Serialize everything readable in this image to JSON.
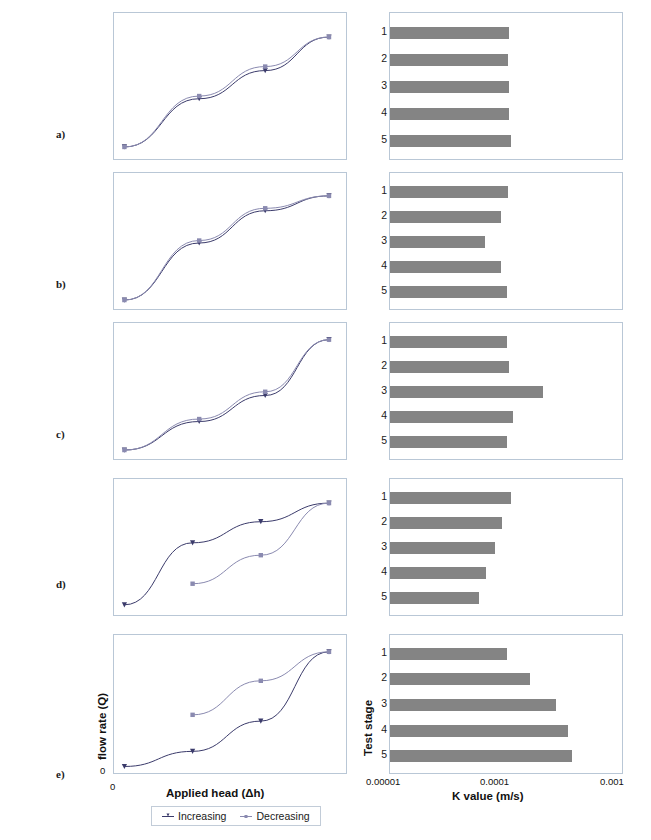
{
  "figure": {
    "rows": [
      {
        "tag": "a)",
        "left_axis_hidden": true
      },
      {
        "tag": "b)",
        "left_axis_hidden": true
      },
      {
        "tag": "c)",
        "left_axis_hidden": true
      },
      {
        "tag": "d)",
        "left_axis_hidden": true
      },
      {
        "tag": "e)",
        "left_axis_hidden": false
      }
    ]
  },
  "labels": {
    "y_axis_left": "flow rate (Q)",
    "x_axis_left": "Applied head (Δh)",
    "y_axis_right": "Test stage",
    "x_axis_right": "K value (m/s)",
    "zero_y": "0",
    "zero_x": "0"
  },
  "legend": {
    "items": [
      {
        "label": "Increasing",
        "color": "#3b3b6b",
        "marker": "line-marker-increasing"
      },
      {
        "label": "Decreasing",
        "color": "#8a8ab0",
        "marker": "line-marker-decreasing"
      }
    ]
  },
  "bar_axis": {
    "ticks": [
      "0.00001",
      "0.0001",
      "0.001"
    ],
    "scale": "log",
    "min": 1e-05,
    "max": 0.001,
    "stage_labels": [
      "1",
      "2",
      "3",
      "4",
      "5"
    ],
    "bar_color": "#848484"
  },
  "chart_data": [
    {
      "id": "a-left",
      "type": "line",
      "panel": "a",
      "title": "",
      "xlabel": "Applied head (Δh)",
      "ylabel": "flow rate (Q)",
      "xlim": [
        0,
        1
      ],
      "ylim": [
        0,
        1
      ],
      "grid": false,
      "legend_position": "bottom",
      "series": [
        {
          "name": "Increasing",
          "x": [
            0.02,
            0.36,
            0.66,
            0.95
          ],
          "y": [
            0.06,
            0.42,
            0.63,
            0.88
          ]
        },
        {
          "name": "Decreasing",
          "x": [
            0.02,
            0.36,
            0.66,
            0.95
          ],
          "y": [
            0.06,
            0.44,
            0.66,
            0.88
          ]
        }
      ]
    },
    {
      "id": "a-right",
      "type": "bar",
      "panel": "a",
      "title": "",
      "xlabel": "K value (m/s)",
      "ylabel": "Test stage",
      "orientation": "horizontal",
      "xscale": "log",
      "xlim": [
        1e-05,
        0.001
      ],
      "categories": [
        "1",
        "2",
        "3",
        "4",
        "5"
      ],
      "values": [
        0.000105,
        0.000102,
        0.000104,
        0.000103,
        0.000108
      ]
    },
    {
      "id": "b-left",
      "type": "line",
      "panel": "b",
      "title": "",
      "xlabel": "Applied head (Δh)",
      "ylabel": "flow rate (Q)",
      "xlim": [
        0,
        1
      ],
      "ylim": [
        0,
        1
      ],
      "grid": false,
      "series": [
        {
          "name": "Increasing",
          "x": [
            0.02,
            0.36,
            0.66,
            0.95
          ],
          "y": [
            0.04,
            0.5,
            0.76,
            0.88
          ]
        },
        {
          "name": "Decreasing",
          "x": [
            0.02,
            0.36,
            0.66,
            0.95
          ],
          "y": [
            0.04,
            0.52,
            0.78,
            0.88
          ]
        }
      ]
    },
    {
      "id": "b-right",
      "type": "bar",
      "panel": "b",
      "title": "",
      "xlabel": "K value (m/s)",
      "ylabel": "Test stage",
      "orientation": "horizontal",
      "xscale": "log",
      "xlim": [
        1e-05,
        0.001
      ],
      "categories": [
        "1",
        "2",
        "3",
        "4",
        "5"
      ],
      "values": [
        0.000101,
        8.95e-05,
        6.45e-05,
        8.95e-05,
        0.0001
      ]
    },
    {
      "id": "c-left",
      "type": "line",
      "panel": "c",
      "title": "",
      "xlabel": "Applied head (Δh)",
      "ylabel": "flow rate (Q)",
      "xlim": [
        0,
        1
      ],
      "ylim": [
        0,
        1
      ],
      "grid": false,
      "series": [
        {
          "name": "Increasing",
          "x": [
            0.02,
            0.36,
            0.66,
            0.95
          ],
          "y": [
            0.04,
            0.27,
            0.48,
            0.93
          ]
        },
        {
          "name": "Decreasing",
          "x": [
            0.02,
            0.36,
            0.66,
            0.95
          ],
          "y": [
            0.04,
            0.29,
            0.51,
            0.93
          ]
        }
      ]
    },
    {
      "id": "c-right",
      "type": "bar",
      "panel": "c",
      "title": "",
      "xlabel": "K value (m/s)",
      "ylabel": "Test stage",
      "orientation": "horizontal",
      "xscale": "log",
      "xlim": [
        1e-05,
        0.001
      ],
      "categories": [
        "1",
        "2",
        "3",
        "4",
        "5"
      ],
      "values": [
        0.0001,
        0.000105,
        0.000205,
        0.000112,
        0.0001
      ]
    },
    {
      "id": "d-left",
      "type": "line",
      "panel": "d",
      "title": "",
      "xlabel": "Applied head (Δh)",
      "ylabel": "flow rate (Q)",
      "xlim": [
        0,
        1
      ],
      "ylim": [
        0,
        1
      ],
      "grid": false,
      "series": [
        {
          "name": "Increasing",
          "x": [
            0.02,
            0.33,
            0.64,
            0.95
          ],
          "y": [
            0.05,
            0.55,
            0.72,
            0.87
          ]
        },
        {
          "name": "Decreasing",
          "x": [
            0.33,
            0.64,
            0.95
          ],
          "y": [
            0.22,
            0.45,
            0.87
          ]
        }
      ]
    },
    {
      "id": "d-right",
      "type": "bar",
      "panel": "d",
      "title": "",
      "xlabel": "K value (m/s)",
      "ylabel": "Test stage",
      "orientation": "horizontal",
      "xscale": "log",
      "xlim": [
        1e-05,
        0.001
      ],
      "categories": [
        "1",
        "2",
        "3",
        "4",
        "5"
      ],
      "values": [
        0.000108,
        9.05e-05,
        7.85e-05,
        6.55e-05,
        5.75e-05
      ]
    },
    {
      "id": "e-left",
      "type": "line",
      "panel": "e",
      "title": "",
      "xlabel": "Applied head (Δh)",
      "ylabel": "flow rate (Q)",
      "xlim": [
        0,
        1
      ],
      "ylim": [
        0,
        1
      ],
      "grid": false,
      "series": [
        {
          "name": "Increasing",
          "x": [
            0.02,
            0.33,
            0.64,
            0.95
          ],
          "y": [
            0.02,
            0.14,
            0.38,
            0.93
          ]
        },
        {
          "name": "Decreasing",
          "x": [
            0.33,
            0.64,
            0.95
          ],
          "y": [
            0.43,
            0.7,
            0.93
          ]
        }
      ]
    },
    {
      "id": "e-right",
      "type": "bar",
      "panel": "e",
      "title": "",
      "xlabel": "K value (m/s)",
      "ylabel": "Test stage",
      "orientation": "horizontal",
      "xscale": "log",
      "xlim": [
        1e-05,
        0.001
      ],
      "categories": [
        "1",
        "2",
        "3",
        "4",
        "5"
      ],
      "values": [
        0.0001,
        0.000158,
        0.00026,
        0.00033,
        0.00036
      ]
    }
  ]
}
